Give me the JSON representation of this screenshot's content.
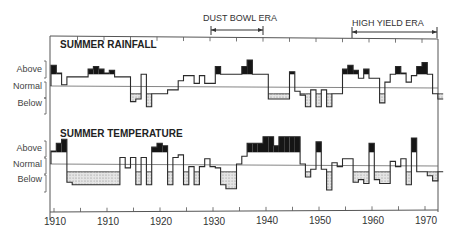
{
  "chart_data": [
    {
      "type": "line",
      "subtype": "step-anomaly",
      "title": "SUMMER RAINFALL",
      "xlabel": "",
      "ylabel": "",
      "y_category_labels": [
        "Above",
        "Normal",
        "Below"
      ],
      "x": [
        1900,
        1901,
        1902,
        1903,
        1904,
        1905,
        1906,
        1907,
        1908,
        1909,
        1910,
        1911,
        1912,
        1913,
        1914,
        1915,
        1916,
        1917,
        1918,
        1919,
        1920,
        1921,
        1922,
        1923,
        1924,
        1925,
        1926,
        1927,
        1928,
        1929,
        1930,
        1931,
        1932,
        1933,
        1934,
        1935,
        1936,
        1937,
        1938,
        1939,
        1940,
        1941,
        1942,
        1943,
        1944,
        1945,
        1946,
        1947,
        1948,
        1949,
        1950,
        1951,
        1952,
        1953,
        1954,
        1955,
        1956,
        1957,
        1958,
        1959,
        1960,
        1961,
        1962,
        1963,
        1964,
        1965,
        1966,
        1967,
        1968,
        1969,
        1970,
        1971,
        1972,
        1973
      ],
      "values": [
        1.6,
        1.0,
        0.1,
        0.7,
        0.7,
        0.7,
        0.7,
        1.3,
        1.5,
        1.3,
        1.0,
        1.2,
        0.7,
        0.7,
        0.7,
        -1.2,
        -1.0,
        0.9,
        -1.6,
        -0.6,
        -0.6,
        -0.6,
        -0.3,
        -0.3,
        0.4,
        0.8,
        0.8,
        0.2,
        0.8,
        0.2,
        0.2,
        1.5,
        0.9,
        0.9,
        0.9,
        0.9,
        1.5,
        2.0,
        0.9,
        0.9,
        0.9,
        -1.0,
        -1.0,
        -1.0,
        -1.0,
        1.1,
        -0.4,
        -0.7,
        -1.6,
        -0.3,
        -1.6,
        -0.3,
        -1.6,
        -0.6,
        -0.6,
        1.3,
        1.6,
        1.2,
        0.6,
        1.3,
        0.6,
        0.6,
        -1.3,
        0.3,
        0.9,
        1.5,
        1.0,
        0.3,
        0.8,
        1.5,
        1.8,
        0.9,
        -0.6,
        -1.0
      ],
      "normal_band": [
        -0.6,
        0.9
      ],
      "shading": {
        "above_band": "black",
        "below_band": "stippled"
      },
      "annotations": [
        {
          "label": "DUST BOWL ERA",
          "x_start": 1930,
          "x_end": 1940
        },
        {
          "label": "HIGH YIELD ERA",
          "x_start": 1957,
          "x_end": 1974
        }
      ]
    },
    {
      "type": "line",
      "subtype": "step-anomaly",
      "title": "SUMMER TEMPERATURE",
      "xlabel": "",
      "ylabel": "",
      "y_category_labels": [
        "Above",
        "Normal",
        "Below"
      ],
      "x": [
        1900,
        1901,
        1902,
        1903,
        1904,
        1905,
        1906,
        1907,
        1908,
        1909,
        1910,
        1911,
        1912,
        1913,
        1914,
        1915,
        1916,
        1917,
        1918,
        1919,
        1920,
        1921,
        1922,
        1923,
        1924,
        1925,
        1926,
        1927,
        1928,
        1929,
        1930,
        1931,
        1932,
        1933,
        1934,
        1935,
        1936,
        1937,
        1938,
        1939,
        1940,
        1941,
        1942,
        1943,
        1944,
        1945,
        1946,
        1947,
        1948,
        1949,
        1950,
        1951,
        1952,
        1953,
        1954,
        1955,
        1956,
        1957,
        1958,
        1959,
        1960,
        1961,
        1962,
        1963,
        1964,
        1965,
        1966,
        1967,
        1968,
        1969,
        1970,
        1971,
        1972,
        1973
      ],
      "values": [
        1.0,
        1.6,
        1.9,
        -1.4,
        -1.6,
        -1.6,
        -1.6,
        -1.6,
        -1.6,
        -1.6,
        -1.6,
        -1.6,
        -1.6,
        0.5,
        -0.3,
        0.5,
        -1.6,
        0.5,
        -1.6,
        1.3,
        1.6,
        1.4,
        -1.6,
        0.5,
        0.7,
        -1.6,
        -0.2,
        -1.6,
        -0.2,
        0.4,
        -0.2,
        -0.3,
        -1.6,
        -1.9,
        -1.9,
        0.0,
        0.6,
        1.6,
        1.6,
        1.6,
        2.1,
        2.1,
        1.4,
        2.1,
        2.1,
        2.1,
        2.1,
        0.0,
        -1.0,
        -0.4,
        1.7,
        -0.4,
        -2.0,
        0.1,
        -0.2,
        0.4,
        0.4,
        -1.4,
        -1.2,
        -1.5,
        1.6,
        -1.2,
        -1.5,
        -1.5,
        0.2,
        -0.2,
        0.4,
        -1.6,
        2.0,
        -0.6,
        -0.6,
        -0.9,
        -1.3,
        -0.6
      ],
      "normal_band": [
        -0.6,
        0.9
      ],
      "shading": {
        "above_band": "black",
        "below_band": "stippled"
      }
    }
  ],
  "axis": {
    "x_tick_labels": [
      {
        "text": "1910",
        "year": 1900
      },
      {
        "text": "1910",
        "year": 1910
      },
      {
        "text": "1920",
        "year": 1920
      },
      {
        "text": "1930",
        "year": 1930
      },
      {
        "text": "1940",
        "year": 1940
      },
      {
        "text": "1950",
        "year": 1950
      },
      {
        "text": "1960",
        "year": 1960
      },
      {
        "text": "1970",
        "year": 1970
      }
    ],
    "x_range": [
      1899.8,
      1973.5
    ]
  },
  "panels": {
    "rainfall": {
      "title": "SUMMER RAINFALL",
      "above": "Above",
      "normal": "Normal",
      "below": "Below"
    },
    "temperature": {
      "title": "SUMMER TEMPERATURE",
      "above": "Above",
      "normal": "Normal",
      "below": "Below"
    }
  },
  "eras": {
    "dust_bowl": "DUST BOWL ERA",
    "high_yield": "HIGH YIELD ERA"
  },
  "colors": {
    "line": "#2a2a2a",
    "above_fill": "#151515",
    "below_fill": "#d6d6d6",
    "frame": "#444444"
  }
}
